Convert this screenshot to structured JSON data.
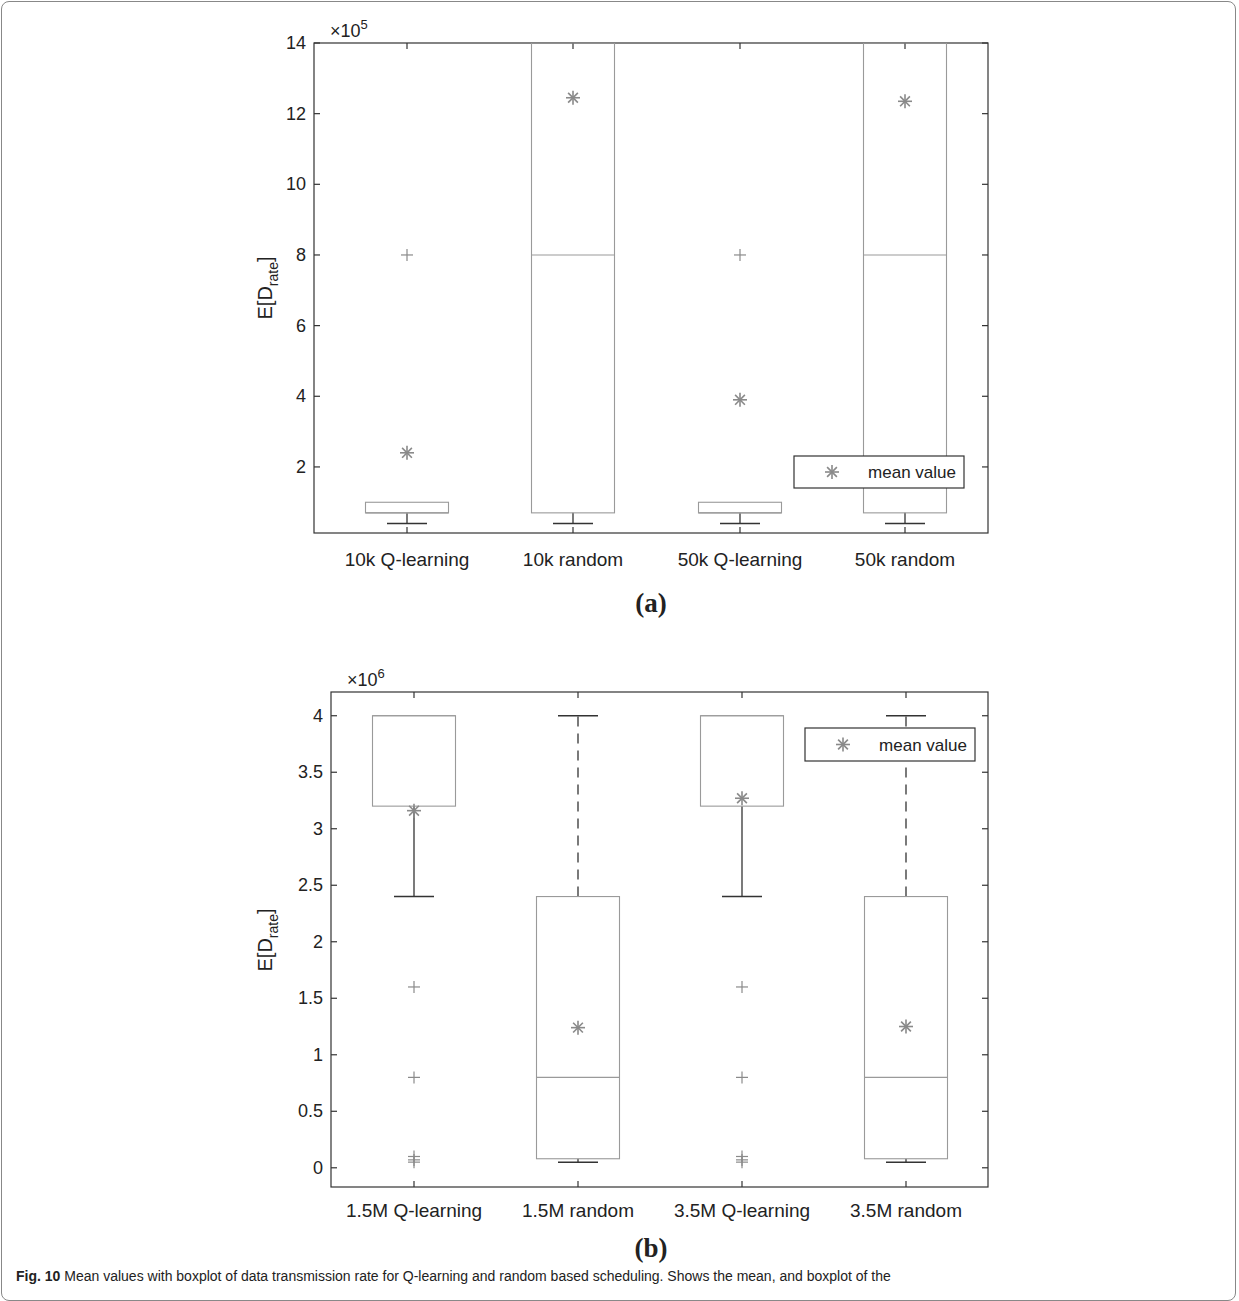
{
  "figure": {
    "caption_label": "Fig. 10",
    "caption_text": "Mean values with boxplot of data transmission rate for Q-learning and random based scheduling. Shows the mean, and boxplot of the"
  },
  "chart_data": [
    {
      "id": "a",
      "type": "box",
      "sublabel": "(a)",
      "title": "",
      "xlabel": "",
      "ylabel": "E[D_rate]",
      "ylabel_main": "E[D",
      "ylabel_sub": "rate",
      "ylabel_end": "]",
      "exponent_label": "×10",
      "exponent_power": "5",
      "ylim": [
        0.13,
        14
      ],
      "yticks": [
        2,
        4,
        6,
        8,
        10,
        12,
        14
      ],
      "ytick_labels": [
        "2",
        "4",
        "6",
        "8",
        "10",
        "12",
        "14"
      ],
      "grid": false,
      "legend": {
        "label": "mean value",
        "marker": "asterisk",
        "position": "lower right"
      },
      "categories": [
        "10k Q-learning",
        "10k random",
        "50k Q-learning",
        "50k random"
      ],
      "boxes": [
        {
          "q1": 0.7,
          "median": 0.7,
          "q3": 1.0,
          "whisker_low": 0.4,
          "whisker_high": 0.7,
          "outliers": [
            8.0
          ],
          "mean": 2.4
        },
        {
          "q1": 0.7,
          "median": 8.0,
          "q3": 14.0,
          "whisker_low": 0.4,
          "whisker_high": 0.7,
          "outliers": [],
          "mean": 12.45
        },
        {
          "q1": 0.7,
          "median": 0.7,
          "q3": 1.0,
          "whisker_low": 0.4,
          "whisker_high": 0.7,
          "outliers": [
            8.0
          ],
          "mean": 3.9
        },
        {
          "q1": 0.7,
          "median": 8.0,
          "q3": 14.0,
          "whisker_low": 0.4,
          "whisker_high": 0.7,
          "outliers": [],
          "mean": 12.35
        }
      ],
      "units_multiplier": 100000
    },
    {
      "id": "b",
      "type": "box",
      "sublabel": "(b)",
      "title": "",
      "xlabel": "",
      "ylabel": "E[D_rate]",
      "ylabel_main": "E[D",
      "ylabel_sub": "rate",
      "ylabel_end": "]",
      "exponent_label": "×10",
      "exponent_power": "6",
      "ylim": [
        -0.17,
        4.21
      ],
      "yticks": [
        0,
        0.5,
        1,
        1.5,
        2,
        2.5,
        3,
        3.5,
        4
      ],
      "ytick_labels": [
        "0",
        "0.5",
        "1",
        "1.5",
        "2",
        "2.5",
        "3",
        "3.5",
        "4"
      ],
      "grid": false,
      "legend": {
        "label": "mean value",
        "marker": "asterisk",
        "position": "upper right"
      },
      "categories": [
        "1.5M Q-learning",
        "1.5M random",
        "3.5M Q-learning",
        "3.5M random"
      ],
      "boxes": [
        {
          "q1": 3.2,
          "median": 4.0,
          "q3": 4.0,
          "whisker_low": 2.4,
          "whisker_high": 4.0,
          "outliers": [
            1.6,
            0.8,
            0.1,
            0.07,
            0.05
          ],
          "mean": 3.16
        },
        {
          "q1": 0.08,
          "median": 0.8,
          "q3": 2.4,
          "whisker_low": 0.05,
          "whisker_high": 4.0,
          "outliers": [],
          "mean": 1.24
        },
        {
          "q1": 3.2,
          "median": 4.0,
          "q3": 4.0,
          "whisker_low": 2.4,
          "whisker_high": 4.0,
          "outliers": [
            1.6,
            0.8,
            0.1,
            0.07,
            0.05
          ],
          "mean": 3.27
        },
        {
          "q1": 0.08,
          "median": 0.8,
          "q3": 2.4,
          "whisker_low": 0.05,
          "whisker_high": 4.0,
          "outliers": [],
          "mean": 1.25
        }
      ],
      "units_multiplier": 1000000
    }
  ],
  "colors": {
    "axis": "#333333",
    "box": "#9a9a9a",
    "whisker": "#333333",
    "marker": "#8a8a8a",
    "frame": "#888888"
  }
}
